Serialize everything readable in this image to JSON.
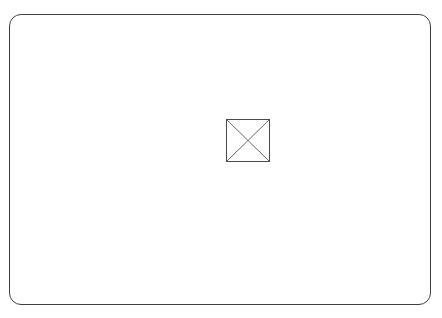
{
  "canvas": {
    "width": 442,
    "height": 318,
    "background_color": "#ffffff"
  },
  "card": {
    "name": "rounded-rectangle-frame",
    "x": 9,
    "y": 14,
    "width": 422,
    "height": 291,
    "corner_radius": 12,
    "border_color": "#3f3f42",
    "border_width": 1,
    "fill_color": "#ffffff",
    "label": "",
    "body_text": ""
  },
  "placeholder": {
    "icon_name": "broken-image-icon",
    "alt_text": "",
    "x": 226,
    "y": 119,
    "width": 44,
    "height": 43,
    "border_color": "#4a4a4d",
    "diagonal_color": "#6b6b6e",
    "fill_color": "#ffffff"
  }
}
